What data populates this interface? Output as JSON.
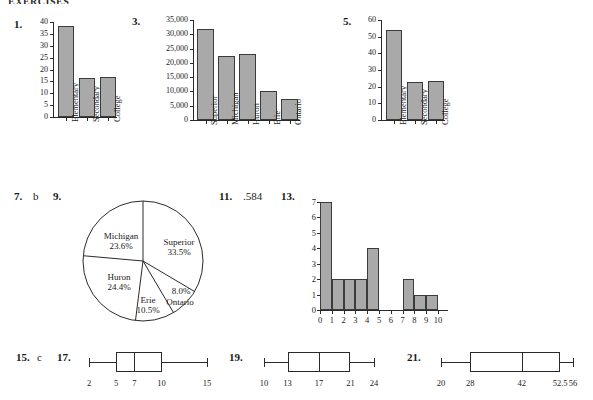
{
  "page": {
    "header": "EXERCISES"
  },
  "answers": [
    {
      "num": "1.",
      "text": ""
    },
    {
      "num": "3.",
      "text": ""
    },
    {
      "num": "5.",
      "text": ""
    },
    {
      "num": "7.",
      "text": "b"
    },
    {
      "num": "9.",
      "text": ""
    },
    {
      "num": "11.",
      "text": ".584"
    },
    {
      "num": "13.",
      "text": ""
    },
    {
      "num": "15.",
      "text": "c"
    },
    {
      "num": "17.",
      "text": ""
    },
    {
      "num": "19.",
      "text": ""
    },
    {
      "num": "21.",
      "text": ""
    }
  ],
  "chart_data": [
    {
      "id": "ex1",
      "type": "bar",
      "title": "",
      "xlabel": "",
      "ylabel": "",
      "categories": [
        "Elementary",
        "Secondary",
        "College"
      ],
      "values": [
        38.5,
        16.3,
        16.8
      ],
      "yticks": [
        0,
        5,
        10,
        15,
        20,
        25,
        30,
        35,
        40
      ],
      "yticklabels": [
        "0",
        "5",
        "10",
        "15",
        "20",
        "25",
        "30",
        "35",
        "40"
      ],
      "ylim": [
        0,
        40
      ],
      "grid": false,
      "legend": "none",
      "bar_color": "#a9a9a9"
    },
    {
      "id": "ex3",
      "type": "bar",
      "title": "",
      "xlabel": "",
      "ylabel": "",
      "categories": [
        "Superior",
        "Michigan",
        "Huron",
        "Erie",
        "Ontario"
      ],
      "values": [
        31700,
        22400,
        23200,
        10000,
        7500
      ],
      "yticks": [
        0,
        5000,
        10000,
        15000,
        20000,
        25000,
        30000,
        35000
      ],
      "yticklabels": [
        "0",
        "5,000",
        "10,000",
        "15,000",
        "20,000",
        "25,000",
        "30,000",
        "35,000"
      ],
      "ylim": [
        0,
        35000
      ],
      "grid": false,
      "legend": "none",
      "bar_color": "#a9a9a9"
    },
    {
      "id": "ex5",
      "type": "bar",
      "title": "",
      "xlabel": "",
      "ylabel": "",
      "categories": [
        "Elementary",
        "Secondary",
        "College"
      ],
      "values": [
        54,
        23,
        23.5
      ],
      "yticks": [
        0,
        10,
        20,
        30,
        40,
        50,
        60
      ],
      "yticklabels": [
        "0",
        "10",
        "20",
        "30",
        "40",
        "50",
        "60"
      ],
      "ylim": [
        0,
        60
      ],
      "grid": false,
      "legend": "none",
      "bar_color": "#a9a9a9"
    },
    {
      "id": "ex9",
      "type": "pie",
      "title": "",
      "slices": [
        {
          "label": "Superior",
          "pct_label": "33.5%",
          "value": 33.5
        },
        {
          "label": "Ontario",
          "pct_label": "8.0%",
          "value": 8.0
        },
        {
          "label": "Erie",
          "pct_label": "10.5%",
          "value": 10.5
        },
        {
          "label": "Huron",
          "pct_label": "24.4%",
          "value": 24.4
        },
        {
          "label": "Michigan",
          "pct_label": "23.6%",
          "value": 23.6
        }
      ],
      "legend": "labels-on-slices",
      "slice_color": "#ffffff"
    },
    {
      "id": "ex13",
      "type": "bar",
      "title": "",
      "xlabel": "",
      "ylabel": "",
      "categories": [
        "0",
        "1",
        "2",
        "3",
        "4",
        "5",
        "6",
        "7",
        "8",
        "9",
        "10"
      ],
      "bin_edges": [
        0,
        1,
        2,
        3,
        4,
        5,
        6,
        7,
        8,
        9,
        10
      ],
      "values": [
        7,
        2,
        2,
        2,
        4,
        0,
        0,
        2,
        1,
        1
      ],
      "yticks": [
        0,
        1,
        2,
        3,
        4,
        5,
        6,
        7
      ],
      "yticklabels": [
        "0",
        "1",
        "2",
        "3",
        "4",
        "5",
        "6",
        "7"
      ],
      "ylim": [
        0,
        7
      ],
      "xlim": [
        0,
        10
      ],
      "grid": false,
      "legend": "none",
      "bar_color": "#a9a9a9"
    },
    {
      "id": "ex17",
      "type": "boxplot",
      "min": 2,
      "q1": 5,
      "median": 7,
      "q3": 10,
      "max": 15,
      "ticklabels": [
        "2",
        "5",
        "7",
        "10",
        "15"
      ],
      "scale_min": 2,
      "scale_max": 15
    },
    {
      "id": "ex19",
      "type": "boxplot",
      "min": 10,
      "q1": 13,
      "median": 17,
      "q3": 21,
      "max": 24,
      "ticklabels": [
        "10",
        "13",
        "17",
        "21",
        "24"
      ],
      "scale_min": 10,
      "scale_max": 24
    },
    {
      "id": "ex21",
      "type": "boxplot",
      "min": 20,
      "q1": 28,
      "median": 42,
      "q3": 52.5,
      "max": 56,
      "ticklabels": [
        "20",
        "28",
        "42",
        "52.5",
        "56"
      ],
      "scale_min": 20,
      "scale_max": 56
    }
  ]
}
